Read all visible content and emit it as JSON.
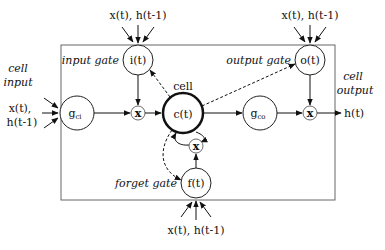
{
  "diagram": {
    "inputs_label": "x(t), h(t-1)",
    "x_inputs_left": [
      "x(t),",
      "h(t-1)"
    ],
    "cell_input_label": [
      "cell",
      "input"
    ],
    "cell_output_label": [
      "cell",
      "output"
    ],
    "nodes": {
      "input_gate": {
        "symbol": "i(t)",
        "label": "input gate"
      },
      "output_gate": {
        "symbol": "o(t)",
        "label": "output gate"
      },
      "forget_gate": {
        "symbol": "f(t)",
        "label": "forget gate"
      },
      "cell": {
        "symbol": "c(t)",
        "label": "cell"
      },
      "g_ci": {
        "symbol": "g",
        "sub": "ci"
      },
      "g_co": {
        "symbol": "g",
        "sub": "co"
      },
      "multiply": "x",
      "output": "h(t)"
    },
    "colors": {
      "stroke": "#222222",
      "box": "#555555",
      "background": "#ffffff"
    }
  }
}
